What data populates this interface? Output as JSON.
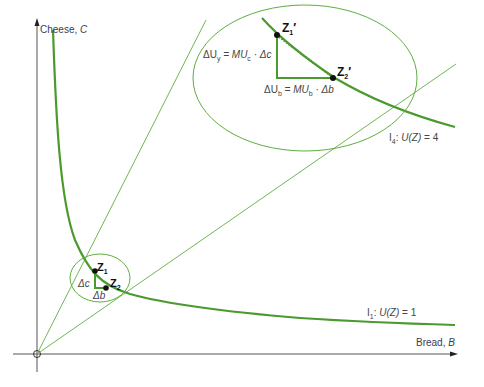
{
  "axes": {
    "y_label": "Cheese, ",
    "y_var": "C",
    "x_label": "Bread, ",
    "x_var": "B"
  },
  "curves": {
    "i1_label_prefix": "I",
    "i1_label_sub": "1",
    "i1_label_func": "U(Z)",
    "i1_label_value": " = 1",
    "i4_label_prefix": "I",
    "i4_label_sub": "4",
    "i4_label_func": "U(Z)",
    "i4_label_value": " = 4"
  },
  "points": {
    "z1": "Z",
    "z1_sub": "1",
    "z2": "Z",
    "z2_sub": "2",
    "z1p": "Z",
    "z1p_sub": "1",
    "z1p_prime": "′",
    "z2p": "Z",
    "z2p_sub": "2",
    "z2p_prime": "′"
  },
  "small_detail": {
    "delta_c": "Δc",
    "delta_b": "Δb"
  },
  "large_detail": {
    "delta_uy_left": "ΔU",
    "delta_uy_sub": "y",
    "delta_uy_mid": " = MU",
    "delta_uy_mu_sub": "c",
    "delta_uy_right": " · Δc",
    "delta_ub_left": "ΔU",
    "delta_ub_sub": "b",
    "delta_ub_mid": " = MU",
    "delta_ub_mu_sub": "b",
    "delta_ub_right": " · Δb"
  },
  "colors": {
    "curve": "#4a9a2e",
    "thin_line": "#5fae3f",
    "axis": "#555555",
    "point": "#111111"
  }
}
